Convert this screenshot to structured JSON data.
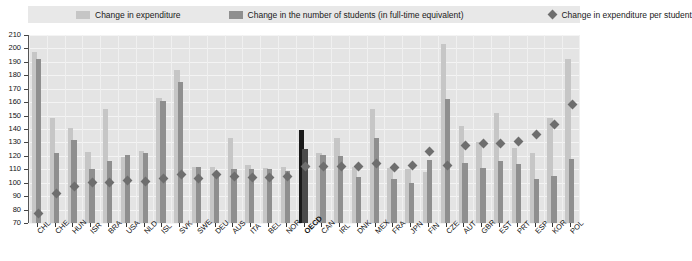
{
  "legend": {
    "entries": [
      {
        "label": "Change in expenditure",
        "marker": "square-swatch",
        "color": "#c6c6c6"
      },
      {
        "label": "Change in the number of students (in full-time equivalent)",
        "marker": "square-swatch",
        "color": "#8f8f8f"
      },
      {
        "label": "Change in expenditure per student",
        "marker": "diamond-marker",
        "color": "#6e6e6e"
      }
    ]
  },
  "chart_data": {
    "type": "bar",
    "title": "",
    "subtitle": "",
    "xlabel": "",
    "ylabel": "",
    "ylim": [
      70,
      210
    ],
    "yticks": [
      70,
      80,
      90,
      100,
      110,
      120,
      130,
      140,
      150,
      160,
      170,
      180,
      190,
      200,
      210
    ],
    "grid": true,
    "legend_position": "top",
    "baseline": 100,
    "highlight_category": "OECD",
    "highlight_color": "#1a1a1a",
    "categories": [
      "CHL",
      "CHE",
      "HUN",
      "ISR",
      "BRA",
      "USA",
      "NLD",
      "ISL",
      "SVK",
      "SWE",
      "DEU",
      "AUS",
      "ITA",
      "BEL",
      "NOR",
      "OECD",
      "CAN",
      "IRL",
      "DNK",
      "MEX",
      "FRA",
      "JPN",
      "FIN",
      "CZE",
      "AUT",
      "GBR",
      "EST",
      "PRT",
      "ESP",
      "KOR",
      "POL"
    ],
    "series": [
      {
        "name": "Change in expenditure",
        "color": "#c6c6c6",
        "values": [
          197,
          148,
          141,
          123,
          155,
          119,
          124,
          163,
          184,
          112,
          112,
          133,
          113,
          111,
          112,
          139,
          122,
          133,
          112,
          155,
          111,
          110,
          108,
          203,
          142,
          130,
          152,
          126,
          122,
          148,
          192
        ]
      },
      {
        "name": "Change in the number of students (in full-time equivalent)",
        "color": "#8f8f8f",
        "values": [
          192,
          122,
          132,
          110,
          116,
          121,
          122,
          161,
          175,
          112,
          105,
          110,
          110,
          110,
          109,
          125,
          121,
          120,
          104,
          133,
          103,
          100,
          117,
          162,
          115,
          111,
          116,
          114,
          103,
          105,
          118
        ]
      },
      {
        "name": "Change in expenditure per student",
        "color": "#6e6e6e",
        "type": "diamond",
        "values": [
          77,
          92,
          97,
          100,
          100,
          102,
          101,
          103,
          106,
          103,
          106,
          105,
          104,
          104,
          105,
          112,
          112,
          112,
          112,
          114,
          111,
          113,
          123,
          113,
          128,
          129,
          129,
          131,
          136,
          143,
          158
        ]
      }
    ]
  }
}
